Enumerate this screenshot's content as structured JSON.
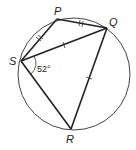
{
  "diagram": {
    "type": "cyclic-quadrilateral",
    "circle": {
      "cx": 74,
      "cy": 74,
      "r": 56
    },
    "points": {
      "P": {
        "label": "P",
        "x": 57,
        "y": 19
      },
      "Q": {
        "label": "Q",
        "x": 107,
        "y": 28
      },
      "S": {
        "label": "S",
        "x": 21,
        "y": 61
      },
      "R": {
        "label": "R",
        "x": 71,
        "y": 129
      }
    },
    "segments": [
      "SP",
      "PQ",
      "SQ",
      "QR",
      "SR"
    ],
    "equal_marks": {
      "single_tick": [
        "SQ",
        "QR"
      ],
      "double_tick": [
        "SP",
        "PQ"
      ]
    },
    "angle": {
      "vertex": "S",
      "between": [
        "Q",
        "R"
      ],
      "label": "52°"
    },
    "labels": {
      "P": "P",
      "Q": "Q",
      "S": "S",
      "R": "R",
      "angle": "52°"
    }
  }
}
